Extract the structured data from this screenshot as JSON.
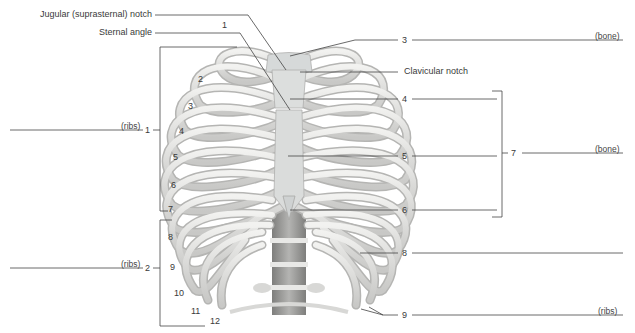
{
  "figure": {
    "structure_labels": {
      "jugular_notch": "Jugular (suprasternal) notch",
      "sternal_angle": "Sternal angle",
      "clavicular_notch": "Clavicular notch"
    },
    "rib_numbers": [
      "1",
      "2",
      "3",
      "4",
      "5",
      "6",
      "7",
      "8",
      "9",
      "10",
      "11",
      "12"
    ],
    "blanks": [
      {
        "id": "1",
        "number": "1",
        "hint": "(ribs)",
        "side": "left"
      },
      {
        "id": "2",
        "number": "2",
        "hint": "(ribs)",
        "side": "left"
      },
      {
        "id": "3",
        "number": "3",
        "hint": "(bone)",
        "side": "right"
      },
      {
        "id": "4",
        "number": "4",
        "hint": "",
        "side": "right"
      },
      {
        "id": "5",
        "number": "5",
        "hint": "",
        "side": "right"
      },
      {
        "id": "6",
        "number": "6",
        "hint": "",
        "side": "right"
      },
      {
        "id": "7",
        "number": "7",
        "hint": "(bone)",
        "side": "right"
      },
      {
        "id": "8",
        "number": "8",
        "hint": "",
        "side": "right"
      },
      {
        "id": "9",
        "number": "9",
        "hint": "(ribs)",
        "side": "right"
      }
    ]
  },
  "colors": {
    "bone": "#e4e4e2",
    "bone_shadow": "#b9b9b7",
    "cartilage": "#d3d6d6",
    "vertebra": "#9c9c9a",
    "leader_line": "#444444"
  }
}
